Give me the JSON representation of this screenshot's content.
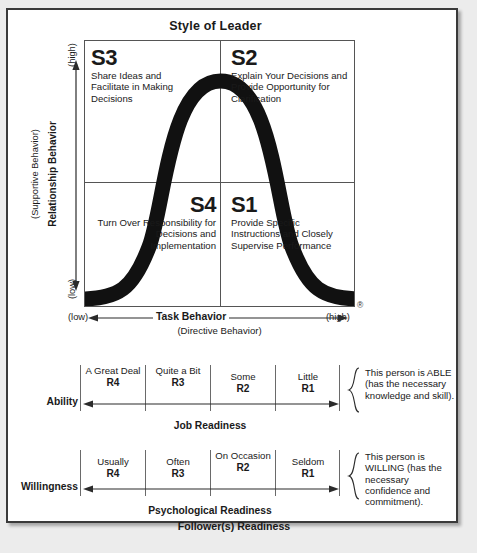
{
  "title": "Style of Leader",
  "matrix": {
    "registered_mark": "®",
    "quadrants": [
      {
        "code": "S3",
        "text": "Share Ideas and Facilitate in Making Decisions"
      },
      {
        "code": "S2",
        "text": "Explain Your Decisions and Provide Opportunity for Clarification"
      },
      {
        "code": "S4",
        "text": "Turn Over Responsibility for Decisions and Implementation"
      },
      {
        "code": "S1",
        "text": "Provide Specific Instructions and Closely Supervise Performance"
      }
    ]
  },
  "y_axis": {
    "outer_label": "(Supportive Behavior)",
    "inner_label": "Relationship Behavior",
    "high": "(high)",
    "low": "(low)"
  },
  "x_axis": {
    "low": "(low)",
    "high": "(high)",
    "label": "Task Behavior",
    "sub_label": "(Directive Behavior)"
  },
  "ability": {
    "label": "Ability",
    "sub_label": "Job Readiness",
    "cells": [
      {
        "text": "A Great Deal",
        "code": "R4"
      },
      {
        "text": "Quite a Bit",
        "code": "R3"
      },
      {
        "text": "Some",
        "code": "R2"
      },
      {
        "text": "Little",
        "code": "R1"
      }
    ],
    "note": "This person is ABLE (has the necessary knowledge and skill)."
  },
  "willingness": {
    "label": "Willingness",
    "sub_label": "Psychological Readiness",
    "cells": [
      {
        "text": "Usually",
        "code": "R4"
      },
      {
        "text": "Often",
        "code": "R3"
      },
      {
        "text": "On Occasion",
        "code": "R2"
      },
      {
        "text": "Seldom",
        "code": "R1"
      }
    ],
    "note": "This person is WILLING (has the necessary confidence and commitment)."
  },
  "footer": "Follower(s) Readiness"
}
